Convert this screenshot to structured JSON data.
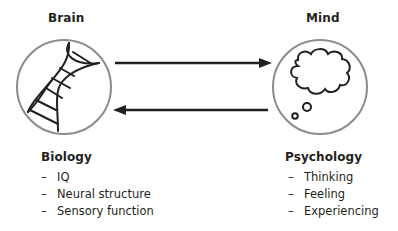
{
  "left": {
    "title": "Brain",
    "icon": "dna-helix-icon",
    "heading": "Biology",
    "items": [
      {
        "dash": "–",
        "label": "IQ"
      },
      {
        "dash": "–",
        "label": "Neural structure"
      },
      {
        "dash": "–",
        "label": "Sensory function"
      }
    ]
  },
  "right": {
    "title": "Mind",
    "icon": "thought-cloud-icon",
    "heading": "Psychology",
    "items": [
      {
        "dash": "–",
        "label": "Thinking"
      },
      {
        "dash": "–",
        "label": "Feeling"
      },
      {
        "dash": "–",
        "label": "Experiencing"
      }
    ]
  },
  "arrows": [
    {
      "direction": "left-to-right",
      "from": "Brain",
      "to": "Mind"
    },
    {
      "direction": "right-to-left",
      "from": "Mind",
      "to": "Brain"
    }
  ],
  "colors": {
    "circle_stroke": "#8c8c8c",
    "line": "#231f20",
    "text": "#231f20"
  }
}
